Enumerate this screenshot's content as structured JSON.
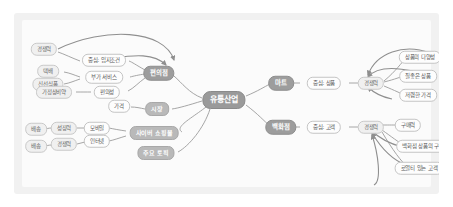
{
  "diagram": {
    "type": "mindmap",
    "background_color": "#fbfbfb",
    "frame_color": "#ffffff",
    "edge_color": "#9a9a9a",
    "root": {
      "label": "유통산업",
      "color": "#9a9a9a",
      "x": 210,
      "y": 87
    },
    "branches": [
      {
        "label": "편의점",
        "color": "#9d9d9d",
        "x": 145,
        "y": 60,
        "children": [
          {
            "label": "중심: 입지조건",
            "color": "#fdfdfd",
            "x": 90,
            "y": 47,
            "children": [
              {
                "label": "경쟁력",
                "color": "#f0f0f0",
                "x": 30,
                "y": 36
              }
            ]
          },
          {
            "label": "부가 서비스",
            "color": "#fdfdfd",
            "x": 90,
            "y": 64,
            "children": [
              {
                "label": "택배",
                "color": "#f0f0f0",
                "x": 34,
                "y": 58
              },
              {
                "label": "신선식품",
                "color": "#f0f0f0",
                "x": 34,
                "y": 71
              }
            ]
          },
          {
            "label": "편의성",
            "color": "#fdfdfd",
            "x": 93,
            "y": 79,
            "children": [
              {
                "label": "가정상비약",
                "color": "#f0f0f0",
                "x": 40,
                "y": 79
              }
            ]
          }
        ]
      },
      {
        "label": "시장",
        "color": "#b9b9b9",
        "x": 143,
        "y": 96,
        "children": [
          {
            "label": "가격",
            "color": "#fdfdfd",
            "x": 105,
            "y": 93
          }
        ]
      },
      {
        "label": "사이버 쇼핑몰",
        "color": "#b9b9b9",
        "x": 140,
        "y": 120,
        "children": [
          {
            "label": "모바일",
            "color": "#fdfdfd",
            "x": 83,
            "y": 115,
            "children": [
              {
                "label": "성장력",
                "color": "#f0f0f0",
                "x": 50,
                "y": 115,
                "children": [
                  {
                    "label": "배송",
                    "color": "#f0f0f0",
                    "x": 22,
                    "y": 116
                  }
                ]
              }
            ]
          },
          {
            "label": "인터넷",
            "color": "#fdfdfd",
            "x": 83,
            "y": 128,
            "children": [
              {
                "label": "경쟁력",
                "color": "#f0f0f0",
                "x": 50,
                "y": 131,
                "children": [
                  {
                    "label": "배송",
                    "color": "#f0f0f0",
                    "x": 22,
                    "y": 133
                  }
                ]
              }
            ]
          }
        ]
      },
      {
        "label": "주요 토픽",
        "color": "#b9b9b9",
        "x": 142,
        "y": 140,
        "children": []
      },
      {
        "label": "마트",
        "color": "#9d9d9d",
        "x": 267,
        "y": 70,
        "children": [
          {
            "label": "중심: 상품",
            "color": "#fdfdfd",
            "x": 310,
            "y": 70,
            "children": [
              {
                "label": "경쟁력",
                "color": "#f0f0f0",
                "x": 357,
                "y": 70,
                "children": [
                  {
                    "label": "상품의 다양성",
                    "color": "#fdfdfd",
                    "x": 406,
                    "y": 44
                  },
                  {
                    "label": "질좋은 상품",
                    "color": "#fdfdfd",
                    "x": 404,
                    "y": 63
                  },
                  {
                    "label": "저렴한 가격",
                    "color": "#fdfdfd",
                    "x": 404,
                    "y": 82
                  }
                ]
              }
            ]
          }
        ]
      },
      {
        "label": "백화점",
        "color": "#9d9d9d",
        "x": 267,
        "y": 114,
        "children": [
          {
            "label": "중심: 고객",
            "color": "#fdfdfd",
            "x": 310,
            "y": 114,
            "children": [
              {
                "label": "경쟁력",
                "color": "#f0f0f0",
                "x": 357,
                "y": 114,
                "children": [
                  {
                    "label": "구매력",
                    "color": "#fdfdfd",
                    "x": 394,
                    "y": 112
                  },
                  {
                    "label": "백화점 상품의 구입",
                    "color": "#fdfdfd",
                    "x": 409,
                    "y": 133
                  },
                  {
                    "label": "로열티 있는 고객",
                    "color": "#fdfdfd",
                    "x": 405,
                    "y": 155
                  }
                ]
              }
            ]
          }
        ]
      }
    ]
  }
}
